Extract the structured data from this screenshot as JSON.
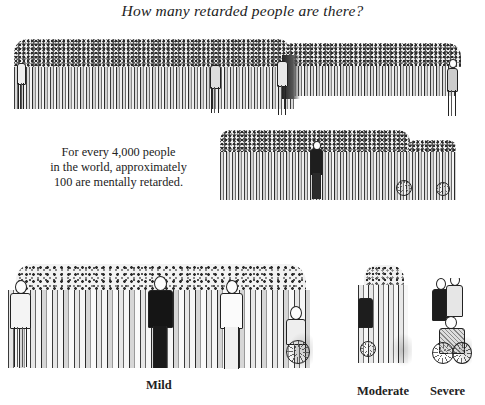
{
  "title": "How many retarded people are there?",
  "caption": {
    "lines": [
      "For every 4,000 people",
      "in the world, approximately",
      "100 are mentally retarded."
    ]
  },
  "illustrations": {
    "world_population_crowd": "crowd of 4,000 people (large group)",
    "retarded_crowd": "crowd of 100 mentally retarded people",
    "mild_group": "mild group illustration",
    "moderate_group": "moderate group illustration",
    "severe_group": "severe group illustration"
  },
  "labels": {
    "mild": "Mild",
    "moderate": "Moderate",
    "severe": "Severe"
  },
  "colors": {
    "ink": "#1a1a1a",
    "paper": "#ffffff"
  }
}
